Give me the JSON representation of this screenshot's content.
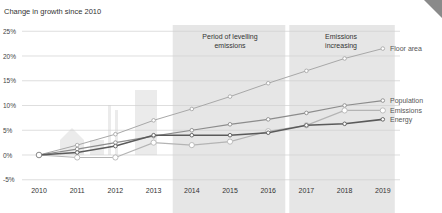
{
  "chart_data": {
    "type": "line",
    "title": "Change in growth since 2010",
    "xlabel": "",
    "ylabel": "Change in growth since 2010",
    "ylim": [
      -5,
      25
    ],
    "yticks": [
      -5,
      0,
      5,
      10,
      15,
      20,
      25
    ],
    "ytick_labels": [
      "-5%",
      "0%",
      "5%",
      "10%",
      "15%",
      "20%",
      "25%"
    ],
    "grid": true,
    "legend_position": "right, inline at line ends",
    "x": [
      2010,
      2011,
      2012,
      2013,
      2014,
      2015,
      2016,
      2017,
      2018,
      2019
    ],
    "series": [
      {
        "name": "Floor area",
        "color": "#a8a8a8",
        "values": [
          0,
          2,
          4.2,
          7,
          9.3,
          11.8,
          14.5,
          17,
          19.5,
          21.5
        ]
      },
      {
        "name": "Population",
        "color": "#8c8c8c",
        "values": [
          0,
          1.2,
          2.5,
          3.8,
          5,
          6.2,
          7.2,
          8.5,
          10,
          11
        ]
      },
      {
        "name": "Emissions",
        "color": "#b4b4b4",
        "values": [
          0,
          -0.5,
          -0.5,
          2.5,
          2,
          2.7,
          4.8,
          6,
          9,
          9
        ]
      },
      {
        "name": "Energy",
        "color": "#5a5a5a",
        "values": [
          0,
          0.5,
          1.8,
          4,
          4,
          4,
          4.5,
          6,
          6.3,
          7.2
        ]
      }
    ],
    "annotations": [
      {
        "label": "Period of levelling emissions",
        "x_start": 2013.5,
        "x_end": 2016.5
      },
      {
        "label": "Emissions increasing",
        "x_start": 2016.5,
        "x_end": 2019
      }
    ]
  }
}
